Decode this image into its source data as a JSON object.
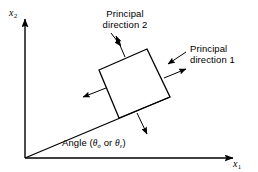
{
  "figure": {
    "background_color": "#ffffff",
    "line_color": "#000000",
    "width": 258,
    "height": 172
  },
  "axes": {
    "x_axis": {
      "label_base": "x",
      "label_sub": "1",
      "name": "horizontal-axis"
    },
    "y_axis": {
      "label_base": "x",
      "label_sub": "2",
      "name": "vertical-axis"
    },
    "origin": {
      "x": 25,
      "y": 158
    }
  },
  "annotations": {
    "principal_direction_2": {
      "line1": "Principal",
      "line2": "direction 2"
    },
    "principal_direction_1": {
      "line1": "Principal",
      "line2": "direction 1"
    },
    "angle": {
      "prefix": "Angle (",
      "theta1_base": "θ",
      "theta1_sub": "σ",
      "conjunction": " or ",
      "theta2_base": "θ",
      "theta2_sub": "ε",
      "suffix": ")"
    }
  },
  "element": {
    "shape": "rotated-square",
    "corners": {
      "top": {
        "x": 147,
        "y": 49
      },
      "right": {
        "x": 170,
        "y": 97
      },
      "bottom": {
        "x": 119,
        "y": 118
      },
      "left": {
        "x": 99,
        "y": 70
      }
    },
    "stress_arrows": [
      {
        "name": "stress-arrow-top",
        "direction": "up-right"
      },
      {
        "name": "stress-arrow-right",
        "direction": "right-up"
      },
      {
        "name": "stress-arrow-bottom",
        "direction": "down-right"
      },
      {
        "name": "stress-arrow-left",
        "direction": "left-down"
      }
    ]
  },
  "leaders": [
    {
      "name": "leader-principal-direction-2",
      "points_to": "top-left-face"
    },
    {
      "name": "leader-principal-direction-1",
      "points_to": "upper-right-face"
    }
  ],
  "inclined_line": {
    "name": "principal-axis-line",
    "from": {
      "x": 25,
      "y": 158
    },
    "to": {
      "x": 170,
      "y": 97
    }
  }
}
